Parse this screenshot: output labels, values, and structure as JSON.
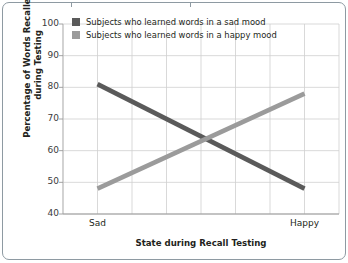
{
  "figure": {
    "background_color": "#ffffff",
    "frame_color": "#8e9aa2"
  },
  "chart_data": {
    "type": "line",
    "title": "",
    "subtitle": "",
    "xlabel": "State during Recall Testing",
    "ylabel": "Percentage of Words Recalled during Testing",
    "ylabel_line1": "Percentage of Words Recalled",
    "ylabel_line2": "during Testing",
    "categories": [
      "Sad",
      "Happy"
    ],
    "x": [
      0,
      1
    ],
    "xtick_labels": [
      "Sad",
      "Happy"
    ],
    "ytick_labels": [
      "40",
      "50",
      "60",
      "70",
      "80",
      "90",
      "100"
    ],
    "yticks": [
      40,
      50,
      60,
      70,
      80,
      90,
      100
    ],
    "ylim": [
      40,
      100
    ],
    "grid": true,
    "grid_color": "#cfcfcf",
    "legend_position": "top-left-inside",
    "series": [
      {
        "name": "Subjects who learned words in a sad mood",
        "color": "#5a5a5a",
        "values": [
          81,
          48
        ]
      },
      {
        "name": "Subjects who learned words in a happy mood",
        "color": "#9b9b9b",
        "values": [
          48,
          78
        ]
      }
    ],
    "annotations": []
  },
  "legend": {
    "items": [
      {
        "label": "Subjects who learned words in a sad mood",
        "color": "#5a5a5a"
      },
      {
        "label": "Subjects who learned words in a happy mood",
        "color": "#9b9b9b"
      }
    ]
  }
}
